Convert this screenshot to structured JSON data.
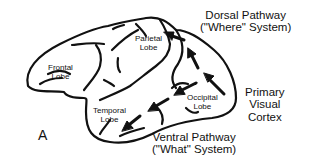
{
  "figure": {
    "panel_label": "A",
    "lobes": {
      "frontal": [
        "Frontal",
        "Lobe"
      ],
      "parietal": [
        "Parietal",
        "Lobe"
      ],
      "temporal": [
        "Temporal",
        "Lobe"
      ],
      "occipital": [
        "Occipital",
        "Lobe"
      ]
    },
    "pathways": {
      "dorsal": [
        "Dorsal Pathway",
        "(\"Where\" System)"
      ],
      "ventral": [
        "Ventral Pathway",
        "(\"What\" System)"
      ]
    },
    "primary_visual_cortex": [
      "Primary",
      "Visual",
      "Cortex"
    ],
    "colors": {
      "stroke": "#111111",
      "background": "#ffffff"
    }
  }
}
